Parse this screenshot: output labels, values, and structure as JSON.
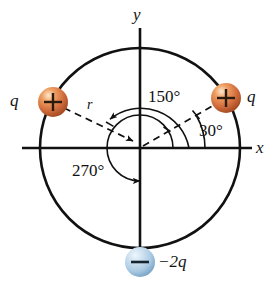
{
  "figure": {
    "background_color": "#ffffff",
    "stroke_color": "#111111",
    "center": {
      "x": 140,
      "y": 148
    },
    "circle_radius": 100
  },
  "axes": {
    "x_label": "x",
    "y_label": "y",
    "x_label_pos": {
      "x": 254,
      "y": 140
    },
    "y_label_pos": {
      "x": 133,
      "y": 8
    }
  },
  "angles": [
    {
      "name": "angle-30",
      "label": "30°",
      "value": 30,
      "pos": {
        "x": 196,
        "y": 121
      }
    },
    {
      "name": "angle-150",
      "label": "150°",
      "value": 150,
      "pos": {
        "x": 140,
        "y": 91
      }
    },
    {
      "name": "angle-270",
      "label": "270°",
      "value": 270,
      "pos": {
        "x": 75,
        "y": 165
      }
    }
  ],
  "radius_label": {
    "text": "r",
    "pos": {
      "x": 90,
      "y": 102
    }
  },
  "charges": [
    {
      "name": "charge-left-positive",
      "label": "q",
      "sign": "+",
      "sign_glyph": "+",
      "angle_deg": 150,
      "color": "#d4703f",
      "color_light": "#f2c39a",
      "color_dark": "#a84a22",
      "label_pos": {
        "x": 12,
        "y": 93
      },
      "center": {
        "x": 53,
        "y": 102
      },
      "radius": 15
    },
    {
      "name": "charge-right-positive",
      "label": "q",
      "sign": "+",
      "sign_glyph": "+",
      "angle_deg": 30,
      "color": "#d4703f",
      "color_light": "#f2c39a",
      "color_dark": "#a84a22",
      "label_pos": {
        "x": 246,
        "y": 93
      },
      "center": {
        "x": 226,
        "y": 98
      },
      "radius": 15
    },
    {
      "name": "charge-bottom-negative",
      "label": "−2q",
      "sign": "−",
      "sign_glyph": "−",
      "angle_deg": 270,
      "color": "#a9c9e2",
      "color_light": "#dceaf5",
      "color_dark": "#6e9cc0",
      "label_pos": {
        "x": 160,
        "y": 256
      },
      "center": {
        "x": 140,
        "y": 262
      },
      "radius": 15
    }
  ]
}
